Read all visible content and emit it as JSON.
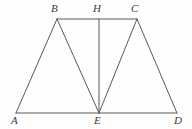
{
  "figure": {
    "background_color": "#fefefe",
    "stroke_color": "#595959",
    "label_color": "#3a3a3a",
    "stroke_width": 1,
    "canvas": {
      "width": 192,
      "height": 129
    },
    "points": [
      {
        "id": "A",
        "label": "A",
        "x": 16,
        "y": 113,
        "label_x": 11,
        "label_y": 115
      },
      {
        "id": "B",
        "label": "B",
        "x": 57,
        "y": 19,
        "label_x": 51,
        "label_y": 3
      },
      {
        "id": "C",
        "label": "C",
        "x": 137,
        "y": 19,
        "label_x": 131,
        "label_y": 3
      },
      {
        "id": "D",
        "label": "D",
        "x": 177,
        "y": 113,
        "label_x": 174,
        "label_y": 115
      },
      {
        "id": "E",
        "label": "E",
        "x": 99,
        "y": 113,
        "label_x": 94,
        "label_y": 115
      },
      {
        "id": "H",
        "label": "H",
        "x": 99,
        "y": 19,
        "label_x": 93,
        "label_y": 3
      }
    ],
    "segments": [
      {
        "id": "AD",
        "from": "A",
        "to": "D",
        "x1": 16,
        "y1": 113,
        "x2": 177,
        "y2": 113
      },
      {
        "id": "BC",
        "from": "B",
        "to": "C",
        "x1": 57,
        "y1": 19,
        "x2": 137,
        "y2": 19
      },
      {
        "id": "AB",
        "from": "A",
        "to": "B",
        "x1": 16,
        "y1": 113,
        "x2": 57,
        "y2": 19
      },
      {
        "id": "BE",
        "from": "B",
        "to": "E",
        "x1": 57,
        "y1": 19,
        "x2": 99,
        "y2": 113
      },
      {
        "id": "EC",
        "from": "E",
        "to": "C",
        "x1": 99,
        "y1": 113,
        "x2": 137,
        "y2": 19
      },
      {
        "id": "CD",
        "from": "C",
        "to": "D",
        "x1": 137,
        "y1": 19,
        "x2": 177,
        "y2": 113
      },
      {
        "id": "HE",
        "from": "H",
        "to": "E",
        "x1": 99,
        "y1": 19,
        "x2": 99,
        "y2": 113
      }
    ]
  }
}
